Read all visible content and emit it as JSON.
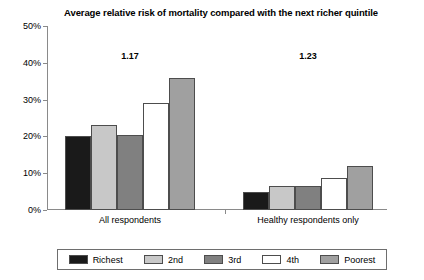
{
  "chart_data": {
    "type": "bar",
    "title": "Average relative risk of mortality compared with the next richer quintile",
    "xlabel": "",
    "ylabel": "",
    "categories": [
      "All respondents",
      "Healthy respondents only"
    ],
    "ylim": [
      0,
      50
    ],
    "y_ticks": [
      "0%",
      "10%",
      "20%",
      "30%",
      "40%",
      "50%"
    ],
    "y_tick_values": [
      0,
      10,
      20,
      30,
      40,
      50
    ],
    "grid": false,
    "legend_position": "bottom",
    "series": [
      {
        "name": "Richest",
        "color": "#1a1a1a",
        "values": [
          20.0,
          5.0
        ]
      },
      {
        "name": "2nd",
        "color": "#c8c8c8",
        "values": [
          23.0,
          6.5
        ]
      },
      {
        "name": "3rd",
        "color": "#808080",
        "values": [
          20.3,
          6.5
        ]
      },
      {
        "name": "4th",
        "color": "#ffffff",
        "values": [
          29.0,
          8.7
        ]
      },
      {
        "name": "Poorest",
        "color": "#a0a0a0",
        "values": [
          36.0,
          12.0
        ]
      }
    ],
    "annotations": [
      {
        "text": "1.17",
        "category": "All respondents",
        "value": 40
      },
      {
        "text": "1.23",
        "category": "Healthy respondents only",
        "value": 40
      }
    ]
  }
}
